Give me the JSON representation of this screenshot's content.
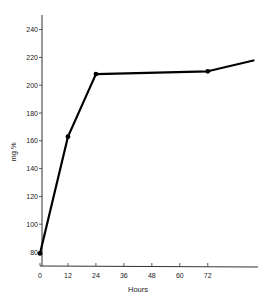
{
  "chart_data": {
    "type": "line",
    "title": "",
    "xlabel": "Hours",
    "ylabel": "mg %",
    "x_ticks": [
      0,
      12,
      24,
      36,
      48,
      60,
      72
    ],
    "y_ticks": [
      80,
      100,
      120,
      140,
      160,
      180,
      200,
      220,
      240
    ],
    "xlim": [
      0,
      92
    ],
    "ylim": [
      70,
      255
    ],
    "grid": false,
    "legend": null,
    "series": [
      {
        "name": "mg %",
        "x": [
          0,
          12,
          24,
          72,
          92
        ],
        "y": [
          79,
          163,
          208,
          210,
          218
        ],
        "markers": [
          true,
          true,
          true,
          true,
          false
        ]
      }
    ]
  }
}
